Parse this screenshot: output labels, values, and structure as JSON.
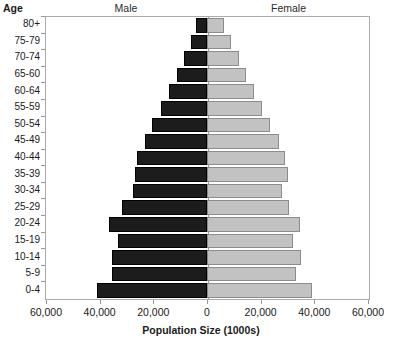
{
  "header": {
    "age_label": "Age",
    "male_label": "Male",
    "female_label": "Female"
  },
  "axis": {
    "x_title": "Population Size (1000s)",
    "x_ticks": [
      "60,000",
      "40,000",
      "20,000",
      "0",
      "20,000",
      "40,000",
      "60,000"
    ],
    "x_tick_values": [
      -60000,
      -40000,
      -20000,
      0,
      20000,
      40000,
      60000
    ]
  },
  "chart_data": {
    "type": "bar",
    "title": "Population Size (1000s)",
    "subtype": "population-pyramid",
    "orientation": "horizontal",
    "xlabel": "Population Size (1000s)",
    "ylabel": "Age",
    "xlim": [
      -60000,
      60000
    ],
    "grid": false,
    "legend": [
      "Male",
      "Female"
    ],
    "legend_position": "top",
    "colors": {
      "male": "#1c1c1c",
      "female": "#c2c2c2"
    },
    "categories": [
      "0-4",
      "5-9",
      "10-14",
      "15-19",
      "20-24",
      "25-29",
      "30-34",
      "35-39",
      "40-44",
      "45-49",
      "50-54",
      "55-59",
      "60-64",
      "65-60",
      "70-74",
      "75-79",
      "80+"
    ],
    "series": [
      {
        "name": "Male",
        "side": "left",
        "values": [
          41000,
          35500,
          35500,
          33000,
          36500,
          31500,
          27500,
          27000,
          26000,
          23000,
          20500,
          17000,
          14000,
          11000,
          8500,
          6000,
          4000
        ]
      },
      {
        "name": "Female",
        "side": "right",
        "values": [
          39000,
          33000,
          35000,
          32000,
          34500,
          30500,
          28000,
          30000,
          29000,
          27000,
          23500,
          20500,
          17500,
          14500,
          12000,
          9000,
          6500
        ]
      }
    ]
  }
}
